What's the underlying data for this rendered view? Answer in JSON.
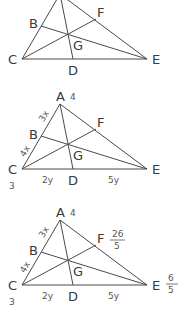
{
  "figures": [
    {
      "id": "figure-1",
      "points": {
        "A": "",
        "B": "B",
        "C": "C",
        "D": "D",
        "E": "E",
        "F": "F",
        "G": "G"
      },
      "annotations": {}
    },
    {
      "id": "figure-2",
      "points": {
        "A": "A",
        "B": "B",
        "C": "C",
        "D": "D",
        "E": "E",
        "F": "F",
        "G": "G"
      },
      "annotations": {
        "A_mass": "4",
        "C_mass": "3",
        "AB": "3x",
        "BC": "4x",
        "CD": "2y",
        "DE": "5y"
      }
    },
    {
      "id": "figure-3",
      "points": {
        "A": "A",
        "B": "B",
        "C": "C",
        "D": "D",
        "E": "E",
        "F": "F",
        "G": "G"
      },
      "annotations": {
        "A_mass": "4",
        "C_mass": "3",
        "AB": "3x",
        "BC": "4x",
        "CD": "2y",
        "DE": "5y",
        "F_mass_num": "26",
        "F_mass_den": "5",
        "E_mass_num": "6",
        "E_mass_den": "5"
      }
    }
  ]
}
